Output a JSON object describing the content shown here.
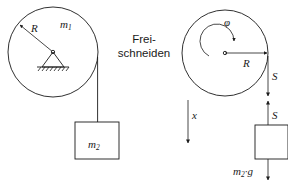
{
  "diagram": {
    "title_text": "",
    "caption_lines": [
      "Frei-",
      "schneiden"
    ],
    "stroke_color": "#1a1a1a",
    "background_color": "#ffffff",
    "left_system": {
      "name": "pulley-with-hanging-mass",
      "pulley_radius_label": "R",
      "pulley_mass_label_base": "m",
      "pulley_mass_label_sub": "1",
      "support_type": "pinned-hatched-support",
      "block_label_base": "m",
      "block_label_sub": "2"
    },
    "right_system": {
      "name": "free-body-diagram",
      "rotation_label": "φ",
      "pulley_radius_label": "R",
      "rope_tension_upper_label": "S",
      "rope_tension_lower_label": "S",
      "displacement_label": "x",
      "weight_label_base": "m",
      "weight_label_sub": "2",
      "weight_label_suffix": "·g"
    }
  }
}
